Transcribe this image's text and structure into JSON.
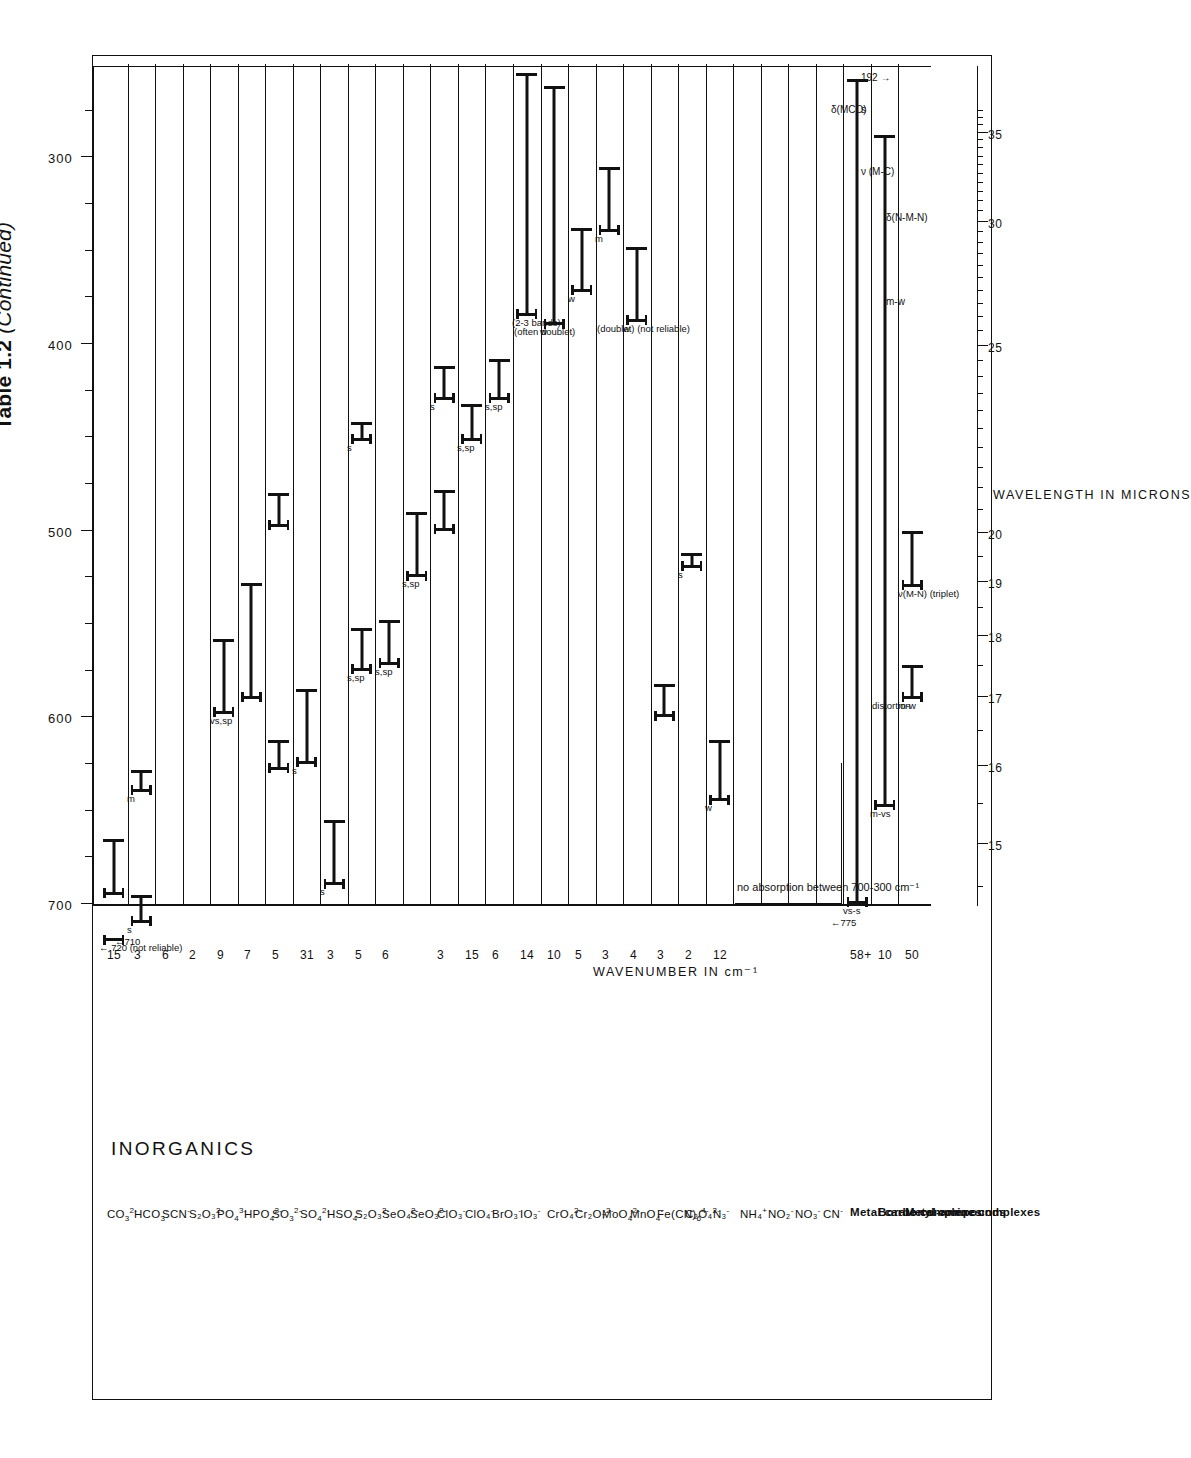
{
  "title": {
    "main": "Table 1.2",
    "continued": "(Continued)"
  },
  "axes": {
    "wavenumber_title": "WAVENUMBER  IN  cm⁻¹",
    "wavenumber_labels": [
      "300",
      "400",
      "500",
      "600",
      "700"
    ],
    "wavenumber_range": [
      700,
      250
    ],
    "micron_title": "WAVELENGTH IN MICRONS",
    "micron_labels": [
      "15",
      "16",
      "17",
      "18",
      "19",
      "20",
      "25",
      "30",
      "35"
    ]
  },
  "section_heading": "INORGANICS",
  "rows": [
    {
      "name": "CO<sub>3</sub><sup>2-</sup>",
      "count": "15",
      "bars": [
        {
          "from": 720,
          "to": 720,
          "type": "arrow",
          "label": "← 720 (not reliable)"
        },
        {
          "from": 695,
          "to": 665,
          "label": ""
        }
      ]
    },
    {
      "name": "HCO<sub>3</sub><sup>-</sup>",
      "count": "3",
      "bars": [
        {
          "from": 710,
          "to": 695,
          "label": "s",
          "arrow": "←710"
        },
        {
          "from": 640,
          "to": 628,
          "label": "m"
        }
      ]
    },
    {
      "name": "SCN<sup>-</sup>",
      "count": "6",
      "bars": []
    },
    {
      "name": "S₂O₃<sup>2-</sup>",
      "count": "2",
      "bars": []
    },
    {
      "name": "PO<sub>4</sub><sup>3-</sup>",
      "count": "9",
      "bars": [
        {
          "from": 598,
          "to": 558,
          "label": "vs,sp"
        }
      ]
    },
    {
      "name": "HPO<sub>4</sub><sup>2-</sup>",
      "count": "7",
      "bars": [
        {
          "from": 590,
          "to": 528,
          "label": ""
        }
      ]
    },
    {
      "name": "SO<sub>3</sub><sup>2-</sup>",
      "count": "5",
      "bars": [
        {
          "from": 628,
          "to": 612,
          "label": ""
        },
        {
          "from": 498,
          "to": 480,
          "label": ""
        }
      ]
    },
    {
      "name": "SO<sub>4</sub><sup>2-</sup>",
      "count": "31",
      "bars": [
        {
          "from": 625,
          "to": 585,
          "label": "s"
        }
      ]
    },
    {
      "name": "HSO<sub>4</sub><sup>-</sup>",
      "count": "3",
      "bars": [
        {
          "from": 690,
          "to": 655,
          "label": "s"
        }
      ]
    },
    {
      "name": "S₂O₃<sup>2-</sup>",
      "count": "5",
      "bars": [
        {
          "from": 575,
          "to": 552,
          "label": "s,sp"
        },
        {
          "from": 452,
          "to": 442,
          "label": "s"
        }
      ]
    },
    {
      "name": "SeO₄<sup>2-</sup>",
      "count": "6",
      "bars": [
        {
          "from": 572,
          "to": 548,
          "label": "s,sp"
        }
      ]
    },
    {
      "name": "SeO₃<sup>2-</sup>",
      "count": "",
      "bars": [
        {
          "from": 525,
          "to": 490,
          "label": "s,sp"
        }
      ]
    },
    {
      "name": "ClO₃<sup>-</sup>",
      "count": "3",
      "bars": [
        {
          "from": 500,
          "to": 478,
          "label": ""
        },
        {
          "from": 430,
          "to": 412,
          "label": "s"
        }
      ]
    },
    {
      "name": "ClO₄<sup>-</sup>",
      "count": "15",
      "bars": [
        {
          "from": 452,
          "to": 432,
          "label": "s,sp"
        }
      ]
    },
    {
      "name": "BrO₃<sup>-</sup>",
      "count": "6",
      "bars": [
        {
          "from": 430,
          "to": 408,
          "label": "s,sp"
        }
      ]
    },
    {
      "name": "IO₃<sup>-</sup>",
      "count": "14",
      "bars": [
        {
          "from": 385,
          "to": 255,
          "label": "(2-3 bands)"
        }
      ]
    },
    {
      "name": "CrO₄<sup>2-</sup>",
      "count": "10",
      "bars": [
        {
          "from": 390,
          "to": 262,
          "label": "w",
          "note": "(often doublet)"
        }
      ]
    },
    {
      "name": "Cr₂O₇<sup>2-</sup>",
      "count": "5",
      "bars": [
        {
          "from": 372,
          "to": 338,
          "label": "w"
        }
      ]
    },
    {
      "name": "MoO<sub>4</sub><sup>2-</sup>",
      "count": "3",
      "bars": [
        {
          "from": 340,
          "to": 305,
          "label": "m"
        }
      ]
    },
    {
      "name": "MnO<sub>4</sub><sup>-</sup>",
      "count": "4",
      "bars": [
        {
          "from": 388,
          "to": 348,
          "label": "w",
          "note": "(doublet) (not reliable)"
        }
      ]
    },
    {
      "name": "Fe(CN)<sub>6</sub><sup>4-</sup>",
      "count": "3",
      "bars": [
        {
          "from": 600,
          "to": 582,
          "label": ""
        }
      ]
    },
    {
      "name": "C₂O₄<sup>2-</sup>",
      "count": "2",
      "bars": [
        {
          "from": 520,
          "to": 512,
          "label": "s"
        }
      ]
    },
    {
      "name": "N₃<sup>-</sup>",
      "count": "12",
      "bars": [
        {
          "from": 645,
          "to": 612,
          "label": "w"
        }
      ]
    },
    {
      "name": "NH₄<sup>+</sup>",
      "count": "",
      "bars": []
    },
    {
      "name": "NO₂<sup>-</sup>",
      "count": "",
      "bars": []
    },
    {
      "name": "NO₃<sup>-</sup>",
      "count": "",
      "bars": []
    },
    {
      "name": "CN<sup>-</sup>",
      "count": "",
      "bars": []
    },
    {
      "name": "Metal carbonyl compounds",
      "bold": true,
      "count": "58+",
      "bars": [
        {
          "from": 700,
          "to": 258,
          "label": "vs-s",
          "arrow": "←775"
        }
      ]
    },
    {
      "name": "Borate complexes",
      "bold": true,
      "count": "10",
      "bars": [
        {
          "from": 648,
          "to": 288,
          "label": "m-vs"
        }
      ]
    },
    {
      "name": "Metal-amine complexes",
      "bold": true,
      "count": "50",
      "bars": [
        {
          "from": 590,
          "to": 572,
          "label": "m-w",
          "note": "distortion"
        },
        {
          "from": 530,
          "to": 500,
          "label": "ν(M-N) (triplet)"
        }
      ]
    }
  ],
  "annotations": {
    "no_absorption": "no absorption between 700-300 cm⁻¹",
    "delta_mco": "δ(MCO)",
    "nu_mc": "ν (M-C)",
    "delta_nmn": "δ(N-M-N)",
    "arrow_192": "192 →",
    "arrow_775": "← 775",
    "arrow_720": "← 720 (not reliable)",
    "arrow_710": "←710",
    "label_s": "s",
    "label_mw": "m-w",
    "label_vs_s": "vs-s",
    "label_m_vs": "m-vs",
    "label_distortion": "distortion",
    "label_mn_triplet": "ν(M-N) (triplet)",
    "label_mw2": "m-w",
    "not_reliable": "(not reliable)",
    "doublet": "(doublet)",
    "often_doublet": "(often doublet)",
    "two_three_bands": "(2-3 bands)",
    "doublet_not_reliable": "(doublet) (not reliable)"
  },
  "colors": {
    "ink": "#111111",
    "paper": "#ffffff"
  }
}
